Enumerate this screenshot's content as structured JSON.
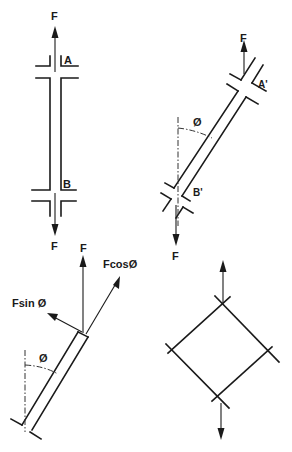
{
  "figure": {
    "panel_vertical_bar": {
      "force_top_label": "F",
      "force_bottom_label": "F",
      "section_top_label": "A",
      "section_bottom_label": "B"
    },
    "panel_inclined_bar": {
      "force_top_label": "F",
      "force_bottom_label": "F",
      "section_top_label": "A'",
      "section_bottom_label": "B'",
      "angle_label": "Ø"
    },
    "panel_force_components": {
      "force_label": "F",
      "axial_component_label": "FcosØ",
      "shear_component_label": "Fsin Ø",
      "angle_label": "Ø"
    },
    "panel_stress_element": {
      "shape": "diamond element with tension arrows"
    },
    "colors": {
      "ink": "#1a1a1a",
      "background": "#ffffff"
    }
  }
}
